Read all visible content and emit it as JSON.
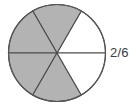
{
  "figure": {
    "label": "2/6",
    "background_color": "#ffffff"
  },
  "chart_data": {
    "type": "pie",
    "title": "",
    "subtitle": "",
    "xlabel": "",
    "ylabel": "",
    "legend_position": "none",
    "grid": false,
    "total_slices": 6,
    "slice_angle_degrees": 60,
    "categories": [
      "wedge-1-upper-right",
      "wedge-2-top",
      "wedge-3-upper-left",
      "wedge-4-lower-left",
      "wedge-5-bottom",
      "wedge-6-lower-right"
    ],
    "values": [
      1,
      1,
      1,
      1,
      1,
      1
    ],
    "slices": [
      {
        "name": "wedge-1-upper-right",
        "start_deg": 0,
        "end_deg": 60,
        "fill": "#ffffff",
        "shaded": false
      },
      {
        "name": "wedge-2-top",
        "start_deg": 60,
        "end_deg": 120,
        "fill": "#b3b3b3",
        "shaded": true
      },
      {
        "name": "wedge-3-upper-left",
        "start_deg": 120,
        "end_deg": 180,
        "fill": "#b3b3b3",
        "shaded": true
      },
      {
        "name": "wedge-4-lower-left",
        "start_deg": 180,
        "end_deg": 240,
        "fill": "#b3b3b3",
        "shaded": true
      },
      {
        "name": "wedge-5-bottom",
        "start_deg": 240,
        "end_deg": 300,
        "fill": "#b3b3b3",
        "shaded": true
      },
      {
        "name": "wedge-6-lower-right",
        "start_deg": 300,
        "end_deg": 360,
        "fill": "#ffffff",
        "shaded": false
      }
    ],
    "shaded_count": 4,
    "unshaded_count": 2,
    "annotations": [
      {
        "text": "2/6",
        "position": "right-of-circle"
      }
    ],
    "colors": {
      "shaded_fill": "#b3b3b3",
      "unshaded_fill": "#ffffff",
      "outline": "#555555",
      "divider": "#4a4a4a",
      "label_text": "#3c3c3c"
    }
  }
}
